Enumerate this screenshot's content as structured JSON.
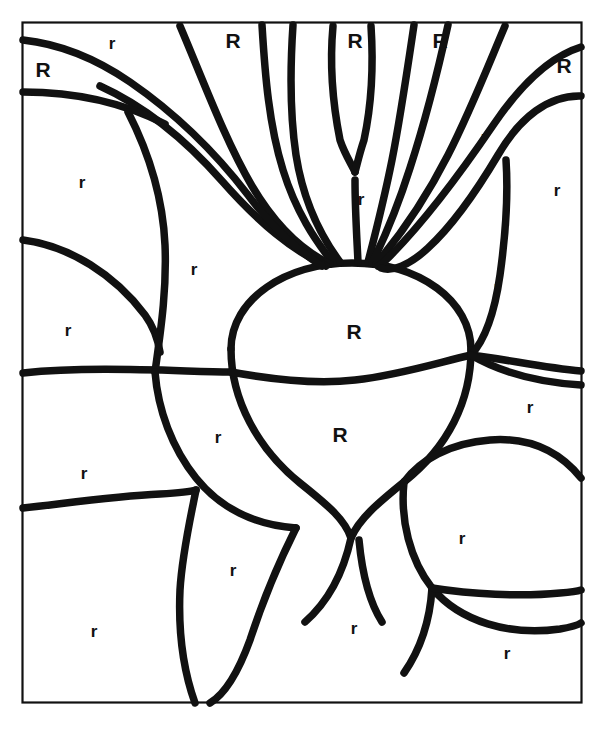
{
  "artwork": {
    "title": "Color by letter radish coloring page",
    "subject": "radish-with-leaves",
    "stroke_color": "#111111",
    "background_color": "#ffffff",
    "frame_color": "#111111"
  },
  "legend": {
    "uppercase_letter": "R",
    "lowercase_letter": "r"
  },
  "labels": [
    {
      "text": "r",
      "case": "lower",
      "x": 112,
      "y": 43
    },
    {
      "text": "R",
      "case": "upper",
      "x": 233,
      "y": 40
    },
    {
      "text": "R",
      "case": "upper",
      "x": 355,
      "y": 40
    },
    {
      "text": "R",
      "case": "upper",
      "x": 440,
      "y": 40
    },
    {
      "text": "R",
      "case": "upper",
      "x": 43,
      "y": 69
    },
    {
      "text": "R",
      "case": "upper",
      "x": 564,
      "y": 65
    },
    {
      "text": "r",
      "case": "lower",
      "x": 484,
      "y": 137
    },
    {
      "text": "r",
      "case": "lower",
      "x": 82,
      "y": 182
    },
    {
      "text": "r",
      "case": "lower",
      "x": 557,
      "y": 190
    },
    {
      "text": "r",
      "case": "lower",
      "x": 361,
      "y": 199
    },
    {
      "text": "r",
      "case": "lower",
      "x": 194,
      "y": 269
    },
    {
      "text": "r",
      "case": "lower",
      "x": 497,
      "y": 287
    },
    {
      "text": "R",
      "case": "upper",
      "x": 354,
      "y": 331
    },
    {
      "text": "r",
      "case": "lower",
      "x": 68,
      "y": 330
    },
    {
      "text": "r",
      "case": "lower",
      "x": 530,
      "y": 407
    },
    {
      "text": "R",
      "case": "upper",
      "x": 340,
      "y": 434
    },
    {
      "text": "r",
      "case": "lower",
      "x": 218,
      "y": 437
    },
    {
      "text": "r",
      "case": "lower",
      "x": 84,
      "y": 473
    },
    {
      "text": "r",
      "case": "lower",
      "x": 462,
      "y": 538
    },
    {
      "text": "r",
      "case": "lower",
      "x": 233,
      "y": 570
    },
    {
      "text": "r",
      "case": "lower",
      "x": 94,
      "y": 631
    },
    {
      "text": "r",
      "case": "lower",
      "x": 354,
      "y": 628
    },
    {
      "text": "r",
      "case": "lower",
      "x": 507,
      "y": 653
    }
  ],
  "frame": {
    "x": 22,
    "y": 22,
    "width": 560,
    "height": 681
  }
}
